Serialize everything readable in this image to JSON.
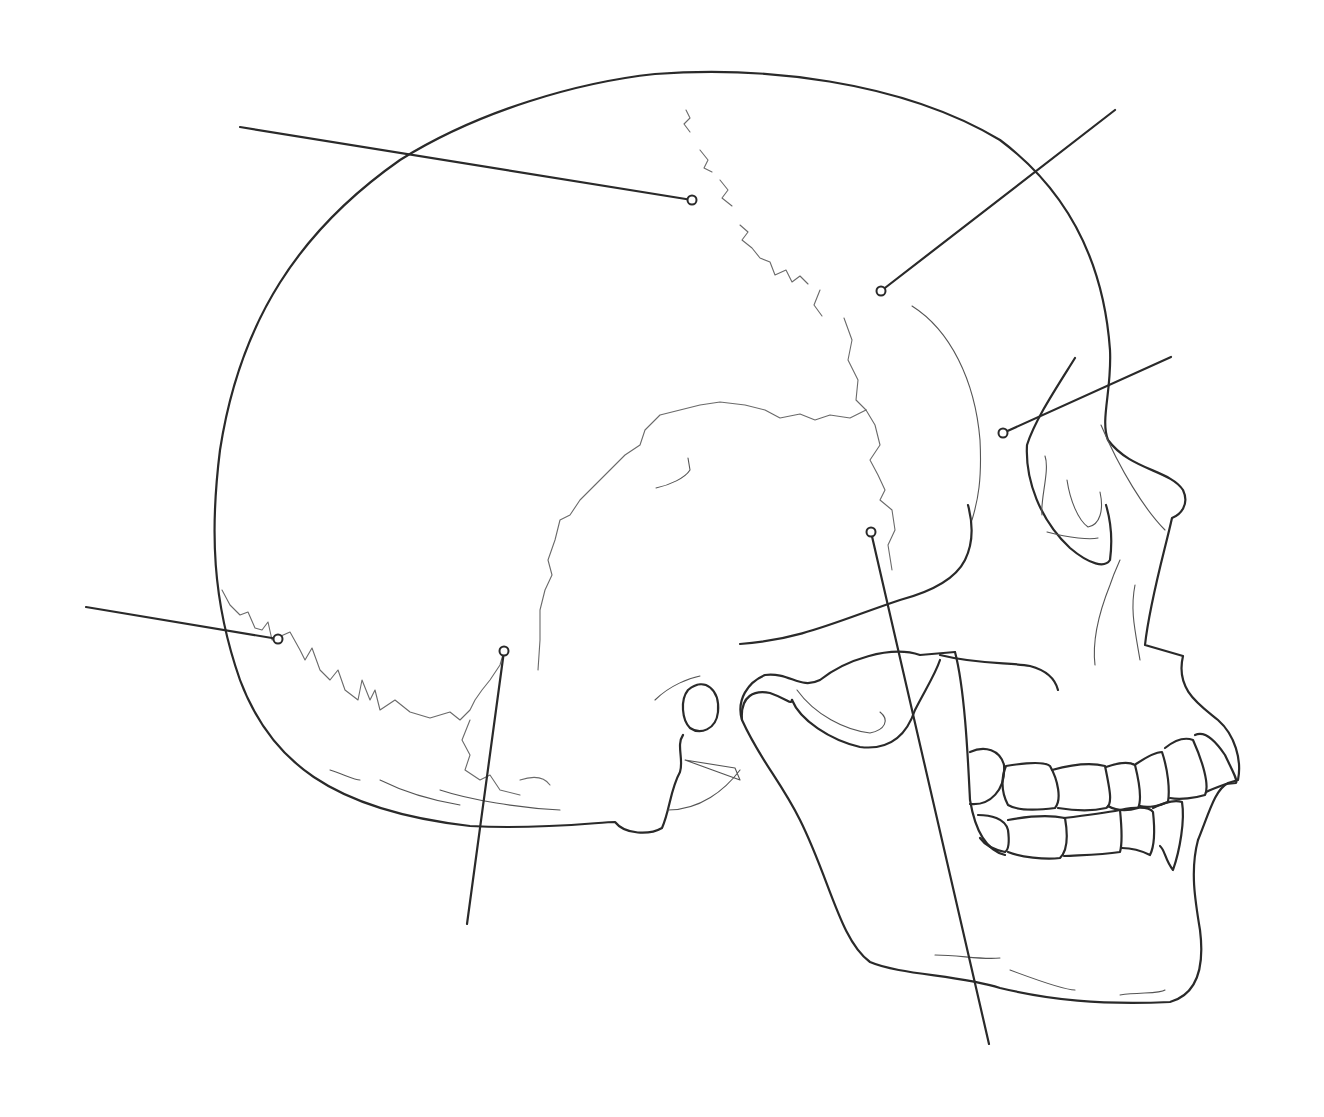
{
  "diagram": {
    "title": "",
    "colors": {
      "line": "#2a2a2a",
      "suture": "#6a6a6a",
      "background": "#ffffff"
    },
    "labels": [
      {
        "id": "label-1",
        "text": "",
        "line_start": [
          240,
          127
        ],
        "point": [
          692,
          200
        ]
      },
      {
        "id": "label-2",
        "text": "",
        "line_start": [
          1115,
          110
        ],
        "point": [
          881,
          291
        ]
      },
      {
        "id": "label-3",
        "text": "",
        "line_start": [
          1171,
          357
        ],
        "point": [
          1003,
          433
        ]
      },
      {
        "id": "label-4",
        "text": "",
        "line_start": [
          86,
          607
        ],
        "point": [
          278,
          639
        ]
      },
      {
        "id": "label-5",
        "text": "",
        "line_start": [
          467,
          924
        ],
        "point": [
          504,
          651
        ]
      },
      {
        "id": "label-6",
        "text": "",
        "line_start": [
          989,
          1044
        ],
        "point": [
          871,
          532
        ]
      }
    ]
  }
}
